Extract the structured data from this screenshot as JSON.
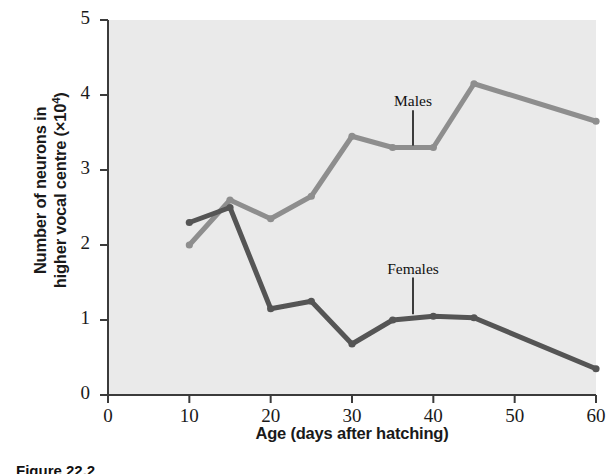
{
  "chart_data": {
    "type": "line",
    "title": "",
    "xlabel": "Age (days after hatching)",
    "ylabel_line1": "Number of neurons in",
    "ylabel_line2_pre": "higher vocal centre (×10",
    "ylabel_line2_exp": "4",
    "ylabel_line2_post": ")",
    "ylabel_full": "Number of neurons in higher vocal centre (×10⁴)",
    "xlim": [
      0,
      60
    ],
    "ylim": [
      0,
      5
    ],
    "xticks": [
      0,
      10,
      20,
      30,
      40,
      50,
      60
    ],
    "yticks": [
      0,
      1,
      2,
      3,
      4,
      5
    ],
    "xtick_labels": [
      "0",
      "10",
      "20",
      "30",
      "40",
      "50",
      "60"
    ],
    "ytick_labels": [
      "0",
      "1",
      "2",
      "3",
      "4",
      "5"
    ],
    "grid": false,
    "legend_position": "inline-annotation",
    "plot_background": "#eaeaea",
    "series": [
      {
        "name": "Males",
        "color": "#8e8e8e",
        "x": [
          10,
          15,
          20,
          25,
          30,
          35,
          40,
          45,
          60
        ],
        "values": [
          2.0,
          2.6,
          2.35,
          2.65,
          3.45,
          3.3,
          3.3,
          4.15,
          3.65
        ]
      },
      {
        "name": "Females",
        "color": "#555555",
        "x": [
          10,
          15,
          20,
          25,
          30,
          35,
          40,
          45,
          60
        ],
        "values": [
          2.3,
          2.5,
          1.15,
          1.25,
          0.68,
          1.0,
          1.05,
          1.03,
          0.35
        ]
      }
    ],
    "annotations": [
      {
        "text": "Males",
        "x": 37.5,
        "y": 3.85,
        "leader_to_y": 3.3
      },
      {
        "text": "Females",
        "x": 37.5,
        "y": 1.62,
        "leader_to_y": 1.05
      }
    ]
  },
  "caption": {
    "text": "Figure 22.2"
  }
}
